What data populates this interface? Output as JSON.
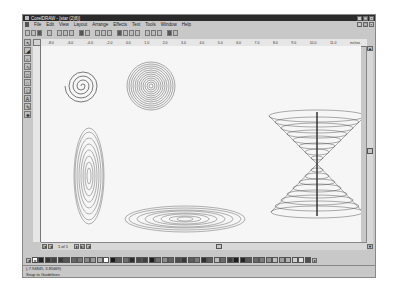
{
  "window": {
    "title": "CorelDRAW - [star (2)8)]",
    "controls": [
      "_",
      "□",
      "×"
    ]
  },
  "menubar": {
    "items": [
      "File",
      "Edit",
      "View",
      "Layout",
      "Arrange",
      "Effects",
      "Text",
      "Tools",
      "Window",
      "Help"
    ]
  },
  "toolbar": {
    "buttons": [
      "new-icon",
      "open-icon",
      "save-icon",
      "print-icon",
      "cut-icon",
      "copy-icon",
      "paste-icon",
      "undo-icon",
      "redo-icon",
      "import-icon",
      "export-icon",
      "zoom-level-icon",
      "wireframe-icon",
      "fullscreen-icon",
      "group-icon",
      "ungroup-icon",
      "to-front-icon",
      "to-back-icon",
      "options-icon",
      "help-icon"
    ]
  },
  "toolbox": {
    "tools": [
      "pick-tool",
      "shape-tool",
      "zoom-tool",
      "freehand-tool",
      "rectangle-tool",
      "ellipse-tool",
      "polygon-tool",
      "text-tool",
      "outline-tool",
      "fill-tool"
    ]
  },
  "ruler": {
    "unit": "inches",
    "ticks": [
      "-8.0",
      "-6.0",
      "-4.0",
      "-2.0",
      "0.0",
      "1.0",
      "2.0",
      "3.0",
      "4.0",
      "5.0",
      "6.0",
      "7.0",
      "8.0",
      "9.0",
      "10.0",
      "11.0",
      "12.0",
      "13.0",
      "14.0",
      "15.0",
      "16.0"
    ]
  },
  "page_nav": {
    "label": "1 of 1"
  },
  "palette": {
    "colors": [
      "#222222",
      "#333333",
      "#444444",
      "#3a3a3a",
      "#555555",
      "#666666",
      "#777777",
      "#888888",
      "#999999",
      "#aaaaaa",
      "#ffffff",
      "#1a1a1a",
      "#5a5a5a",
      "#6e6e6e",
      "#2c2c2c",
      "#4a4a4a",
      "#3e3e3e",
      "#1e1e1e",
      "#707070",
      "#8c8c8c",
      "#626262",
      "#4c4c4c",
      "#383838",
      "#5e5e5e",
      "#7a7a7a",
      "#2e2e2e",
      "#5c5c5c",
      "#bdbdbd",
      "#6a6a6a",
      "#3c3c3c",
      "#1c1c1c",
      "#242424",
      "#585858",
      "#686868",
      "#7c7c7c",
      "#909090",
      "#c0c0c0",
      "#a0a0a0",
      "#b0b0b0",
      "#d0d0d0",
      "#e0e0e0",
      "#4e4e4e",
      "#343434"
    ]
  },
  "status": {
    "coords": "(-7.94845, 3.85669)",
    "selection": "Snap to Guidelines"
  }
}
